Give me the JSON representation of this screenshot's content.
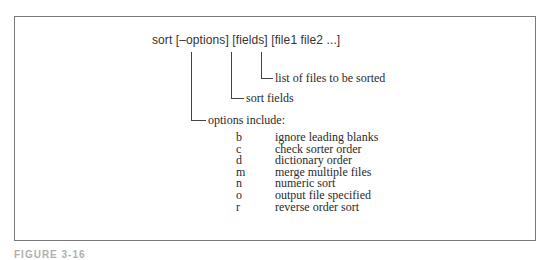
{
  "figure": {
    "command": "sort [–options] [fields] [file1 file2 ...]",
    "callouts": {
      "files": "list of files to be sorted",
      "fields": "sort fields",
      "options": "options include:"
    },
    "options": [
      {
        "flag": "b",
        "description": "ignore leading blanks"
      },
      {
        "flag": "c",
        "description": "check sorter order"
      },
      {
        "flag": "d",
        "description": "dictionary order"
      },
      {
        "flag": "m",
        "description": "merge multiple files"
      },
      {
        "flag": "n",
        "description": "numeric sort"
      },
      {
        "flag": "o",
        "description": "output file specified"
      },
      {
        "flag": "r",
        "description": "reverse order sort"
      }
    ],
    "caption": "FIGURE 3-16"
  },
  "colors": {
    "frame": "#7a7a7a",
    "lines": "#444444",
    "text": "#2a2a2a",
    "background": "#ffffff"
  }
}
